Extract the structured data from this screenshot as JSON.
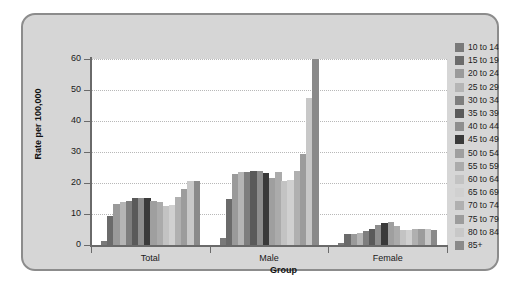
{
  "chart_data": {
    "type": "bar",
    "title": "",
    "xlabel": "Group",
    "ylabel": "Rate per 100,000",
    "categories": [
      "Total",
      "Male",
      "Female"
    ],
    "ylim": [
      0,
      60
    ],
    "yticks": [
      0,
      10,
      20,
      30,
      40,
      50,
      60
    ],
    "ytick_labels": [
      "0",
      "10",
      "20",
      "30",
      "40",
      "50",
      "60"
    ],
    "grid": true,
    "legend_position": "right",
    "legend_title": "",
    "series": [
      {
        "name": "10 to 14",
        "color": "#7a7a7a",
        "values": [
          1.2,
          2.3,
          0.7
        ]
      },
      {
        "name": "15 to 19",
        "color": "#6b6b6b",
        "values": [
          9.5,
          15.0,
          3.4
        ]
      },
      {
        "name": "20 to 24",
        "color": "#9a9a9a",
        "values": [
          13.2,
          22.8,
          3.6
        ]
      },
      {
        "name": "25 to 29",
        "color": "#b5b5b5",
        "values": [
          14.0,
          23.5,
          4.0
        ]
      },
      {
        "name": "30 to 34",
        "color": "#7e7e7e",
        "values": [
          14.2,
          23.4,
          4.6
        ]
      },
      {
        "name": "35 to 39",
        "color": "#5a5a5a",
        "values": [
          15.1,
          23.9,
          5.3
        ]
      },
      {
        "name": "40 to 44",
        "color": "#8e8e8e",
        "values": [
          15.1,
          23.9,
          6.4
        ]
      },
      {
        "name": "45 to 49",
        "color": "#3a3a3a",
        "values": [
          15.1,
          23.2,
          7.2
        ]
      },
      {
        "name": "50 to 54",
        "color": "#9f9f9f",
        "values": [
          14.1,
          21.5,
          7.3
        ]
      },
      {
        "name": "55 to 59",
        "color": "#ababab",
        "values": [
          13.9,
          23.4,
          6.2
        ]
      },
      {
        "name": "60 to 64",
        "color": "#c3c3c3",
        "values": [
          12.6,
          20.8,
          5.0
        ]
      },
      {
        "name": "65 to 69",
        "color": "#d0d0d0",
        "values": [
          12.9,
          20.9,
          4.7
        ]
      },
      {
        "name": "70 to 74",
        "color": "#b0b0b0",
        "values": [
          15.5,
          24.0,
          5.1
        ]
      },
      {
        "name": "75 to 79",
        "color": "#9c9c9c",
        "values": [
          18.1,
          29.4,
          5.1
        ]
      },
      {
        "name": "80 to 84",
        "color": "#c8c8c8",
        "values": [
          20.5,
          47.3,
          5.1
        ]
      },
      {
        "name": "85+",
        "color": "#8a8a8a",
        "values": [
          20.8,
          60.0,
          4.9
        ]
      }
    ]
  },
  "colors": {
    "panel_background": "#d6d6d6",
    "panel_border": "#8c8c8c",
    "plot_background": "#ffffff",
    "axis": "#6a6a6a",
    "gridline": "#b8b8b8",
    "text": "#1a1a1a"
  }
}
